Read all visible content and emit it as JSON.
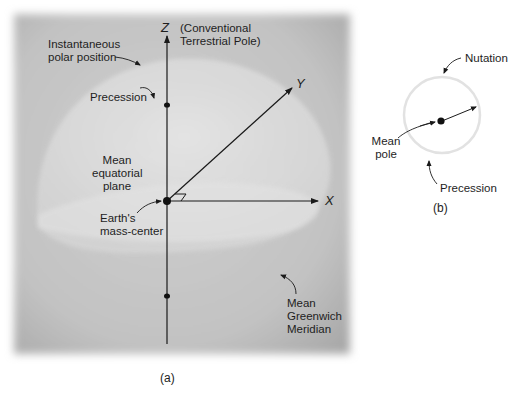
{
  "figure_a": {
    "caption": "(a)",
    "axes": {
      "z": "Z",
      "y": "Y",
      "x": "X"
    },
    "labels": {
      "ctp_line1": "(Conventional",
      "ctp_line2": "Terrestrial Pole)",
      "instantaneous_line1": "Instantaneous",
      "instantaneous_line2": "polar position",
      "precession": "Precession",
      "equatorial_line1": "Mean",
      "equatorial_line2": "equatorial",
      "equatorial_line3": "plane",
      "mass_center_line1": "Earth's",
      "mass_center_line2": "mass-center",
      "greenwich_line1": "Mean",
      "greenwich_line2": "Greenwich",
      "greenwich_line3": "Meridian"
    }
  },
  "figure_b": {
    "caption": "(b)",
    "labels": {
      "nutation": "Nutation",
      "mean_pole_line1": "Mean",
      "mean_pole_line2": "pole",
      "precession": "Precession"
    }
  },
  "colors": {
    "panel_gray": "#bdbdbd",
    "globe_highlight": "#d9d9d9",
    "ink": "#1a1a1a"
  }
}
